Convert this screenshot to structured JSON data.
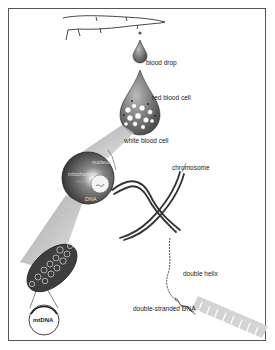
{
  "diagram": {
    "labels": {
      "blood_drop": "blood drop",
      "red_blood_cell": "red blood cell",
      "white_blood_cell": "white blood cell",
      "nucleus": "nucleus",
      "mitochondria": "mitochondria",
      "dna": "DNA",
      "chromosome": "chromosome",
      "mtdna": "mtDNA",
      "double_helix": "double helix",
      "double_stranded_dna": "double-stranded DNA"
    },
    "colors": {
      "frame": "#555555",
      "dark_fill": "#4a4a4a",
      "mid_fill": "#8a8a8a",
      "light_fill": "#d0d0d0",
      "text": "#222222"
    }
  }
}
